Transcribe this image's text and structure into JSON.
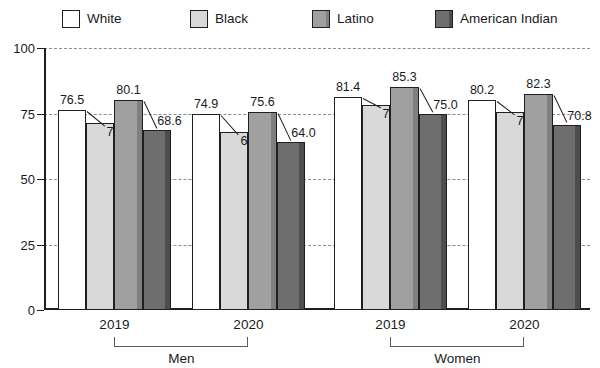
{
  "chart_data": {
    "type": "bar",
    "title": "",
    "xlabel": "",
    "ylabel": "",
    "ylim": [
      0,
      100
    ],
    "yticks": [
      0,
      25,
      50,
      75,
      100
    ],
    "grid": true,
    "legend_position": "top",
    "categories": [
      "2019",
      "2020",
      "2019",
      "2020"
    ],
    "group_labels": [
      "Men",
      "Women"
    ],
    "series": [
      {
        "name": "White",
        "color": "#ffffff",
        "values": [
          76.5,
          74.9,
          81.4,
          80.2
        ]
      },
      {
        "name": "Black",
        "color": "#d9d9d9",
        "values": [
          71.4,
          67.8,
          78.3,
          75.5
        ]
      },
      {
        "name": "Latino",
        "color": "#a0a0a0",
        "values": [
          80.1,
          75.6,
          85.3,
          82.3
        ]
      },
      {
        "name": "American Indian",
        "color": "#6e6e6e",
        "values": [
          68.6,
          64.0,
          75.0,
          70.8
        ]
      }
    ]
  },
  "legend": {
    "items": [
      {
        "label": "White"
      },
      {
        "label": "Black"
      },
      {
        "label": "Latino"
      },
      {
        "label": "American Indian"
      }
    ]
  },
  "axis": {
    "y_tick_labels": [
      "0",
      "25",
      "50",
      "75",
      "100"
    ],
    "x_tick_labels": [
      "2019",
      "2020",
      "2019",
      "2020"
    ],
    "group_labels": [
      "Men",
      "Women"
    ]
  },
  "data_labels": [
    "76.5",
    "71.4",
    "80.1",
    "68.6",
    "74.9",
    "67.8",
    "75.6",
    "64.0",
    "81.4",
    "78.3",
    "85.3",
    "75.0",
    "80.2",
    "75.5",
    "82.3",
    "70.8"
  ]
}
